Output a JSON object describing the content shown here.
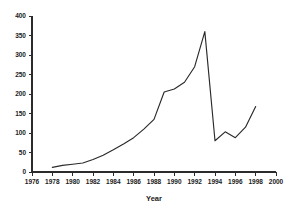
{
  "chart_data": {
    "type": "line",
    "title": "",
    "xlabel": "Year",
    "ylabel": "",
    "xlim": [
      1976,
      2000
    ],
    "ylim": [
      0,
      400
    ],
    "grid": false,
    "legend": null,
    "x_ticks": [
      "1976",
      "1978",
      "1980",
      "1982",
      "1984",
      "1986",
      "1988",
      "1990",
      "1992",
      "1994",
      "1996",
      "1998",
      "2000"
    ],
    "y_ticks": [
      "0",
      "50",
      "100",
      "150",
      "200",
      "250",
      "300",
      "350",
      "400"
    ],
    "x": [
      1978,
      1979,
      1980,
      1981,
      1982,
      1983,
      1984,
      1985,
      1986,
      1987,
      1988,
      1989,
      1990,
      1991,
      1992,
      1993,
      1994,
      1995,
      1996,
      1997,
      1998
    ],
    "values": [
      12,
      17,
      20,
      23,
      32,
      43,
      57,
      72,
      88,
      110,
      135,
      205,
      213,
      230,
      270,
      360,
      80,
      103,
      88,
      115,
      168
    ],
    "series": [
      {
        "name": "value",
        "values": [
          12,
          17,
          20,
          23,
          32,
          43,
          57,
          72,
          88,
          110,
          135,
          205,
          213,
          230,
          270,
          360,
          80,
          103,
          88,
          115,
          168
        ]
      }
    ],
    "line_color": "#2a2a2a",
    "background_color": "#ffffff"
  }
}
